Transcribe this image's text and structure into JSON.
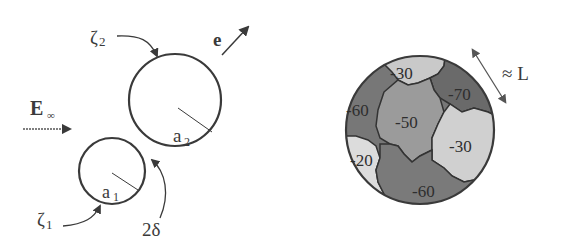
{
  "left_diagram": {
    "field_label": "E",
    "field_subscript": "∞",
    "direction_label": "e",
    "particle_large": {
      "radius_label": "a",
      "radius_subscript": "2",
      "potential_label": "ζ",
      "potential_subscript": "2"
    },
    "particle_small": {
      "radius_label": "a",
      "radius_subscript": "1",
      "potential_label": "ζ",
      "potential_subscript": "1"
    },
    "gap_label": "2δ"
  },
  "right_diagram": {
    "length_label": "≈ L",
    "patches": [
      {
        "id": "top",
        "value": "-30",
        "color": "#c9c9c9"
      },
      {
        "id": "upper-right",
        "value": "-70",
        "color": "#6e6e6e"
      },
      {
        "id": "left",
        "value": "-60",
        "color": "#777777"
      },
      {
        "id": "center",
        "value": "-50",
        "color": "#9a9a9a"
      },
      {
        "id": "right",
        "value": "-30",
        "color": "#cfcfcf"
      },
      {
        "id": "lower-left",
        "value": "-20",
        "color": "#dcdcdc"
      },
      {
        "id": "bottom",
        "value": "-60",
        "color": "#7a7a7a"
      }
    ]
  },
  "colors": {
    "stroke": "#3a3a3a",
    "background": "#ffffff"
  }
}
